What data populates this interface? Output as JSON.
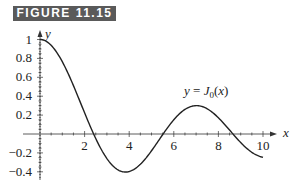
{
  "figure": {
    "label": "FIGURE 11.15"
  },
  "chart_data": {
    "type": "line",
    "title": "",
    "xlabel": "x",
    "ylabel": "y",
    "annotation": "y = J0(x)",
    "xlim": [
      0,
      10.5
    ],
    "ylim": [
      -0.45,
      1.05
    ],
    "x_ticks": [
      2,
      4,
      6,
      8,
      10
    ],
    "x_tick_labels": [
      "2",
      "4",
      "6",
      "8",
      "10"
    ],
    "y_ticks": [
      1,
      0.8,
      0.6,
      0.4,
      0.2,
      -0.2,
      -0.4
    ],
    "y_tick_labels": [
      "1",
      "0.8",
      "0.6",
      "0.4",
      "0.2",
      "−0.2",
      "−0.4"
    ],
    "grid": false,
    "series": [
      {
        "name": "J0(x)",
        "x": [
          0,
          0.5,
          1,
          1.5,
          2,
          2.405,
          3,
          3.5,
          3.832,
          4,
          4.5,
          5,
          5.52,
          6,
          6.5,
          7.016,
          7.5,
          8,
          8.654,
          9,
          9.5,
          10
        ],
        "values": [
          1,
          0.938,
          0.765,
          0.512,
          0.224,
          0,
          -0.26,
          -0.38,
          -0.403,
          -0.397,
          -0.321,
          -0.178,
          0,
          0.151,
          0.26,
          0.3,
          0.266,
          0.172,
          0,
          -0.09,
          -0.194,
          -0.246
        ]
      }
    ]
  }
}
